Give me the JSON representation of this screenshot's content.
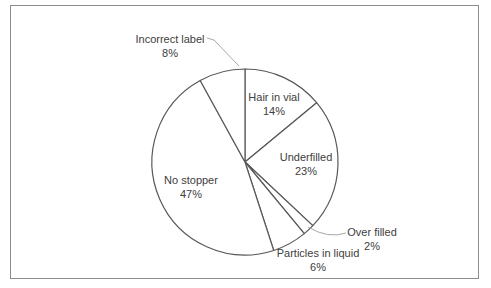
{
  "chart_data": {
    "type": "pie",
    "title": "",
    "categories": [
      "Hair in vial",
      "Underfilled",
      "Over filled",
      "Particles in liquid",
      "No stopper",
      "Incorrect label"
    ],
    "values": [
      14,
      23,
      2,
      6,
      47,
      8
    ],
    "start_angle_deg": 0,
    "direction": "clockwise",
    "slices": [
      {
        "id": "hair-in-vial",
        "label": "Hair in vial",
        "value": 14,
        "pct_label": "14%"
      },
      {
        "id": "underfilled",
        "label": "Underfilled",
        "value": 23,
        "pct_label": "23%"
      },
      {
        "id": "over-filled",
        "label": "Over filled",
        "value": 2,
        "pct_label": "2%"
      },
      {
        "id": "particles-in-liquid",
        "label": "Particles in liquid",
        "value": 6,
        "pct_label": "6%"
      },
      {
        "id": "no-stopper",
        "label": "No stopper",
        "value": 47,
        "pct_label": "47%"
      },
      {
        "id": "incorrect-label",
        "label": "Incorrect label",
        "value": 8,
        "pct_label": "8%"
      }
    ],
    "fill_color": "#ffffff",
    "outline_color": "#595959",
    "label_color": "#404040",
    "leader_line_color": "#a8a8a8",
    "border_color": "#8c8c8c",
    "legend": "none",
    "labels_show": "category name and percentage"
  }
}
